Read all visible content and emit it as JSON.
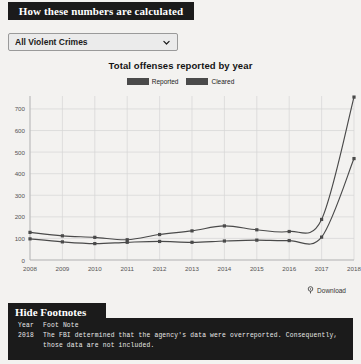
{
  "header": {
    "banner_title": "How these numbers are calculated"
  },
  "filter": {
    "selected": "All Violent Crimes",
    "chevron_icon": "chevron-down-icon"
  },
  "chart_data": {
    "type": "line",
    "title": "Total offenses reported by year",
    "xlabel": "",
    "ylabel": "",
    "x": [
      2008,
      2009,
      2010,
      2011,
      2012,
      2013,
      2014,
      2015,
      2016,
      2017,
      2018
    ],
    "categories": [
      "2008",
      "2009",
      "2010",
      "2011",
      "2012",
      "2013",
      "2014",
      "2015",
      "2016",
      "2017",
      "2018"
    ],
    "series": [
      {
        "name": "Reported",
        "color": "#4a4a4a",
        "values": [
          128,
          112,
          105,
          94,
          118,
          135,
          158,
          140,
          132,
          188,
          755
        ]
      },
      {
        "name": "Cleared",
        "color": "#4a4a4a",
        "values": [
          98,
          84,
          76,
          82,
          86,
          82,
          88,
          92,
          90,
          106,
          470
        ]
      }
    ],
    "ylim": [
      0,
      750
    ],
    "yticks": [
      0,
      100,
      200,
      300,
      400,
      500,
      600,
      700
    ],
    "ytick_labels": [
      "0",
      "100",
      "200",
      "300",
      "400",
      "500",
      "600",
      "700"
    ],
    "grid": true,
    "legend_position": "top-center",
    "legend": [
      "Reported",
      "Cleared"
    ]
  },
  "download": {
    "label": "Download",
    "icon": "download-pin-icon"
  },
  "footnotes": {
    "toggle_label": "Hide Footnotes",
    "columns": {
      "year": "Year",
      "note": "Foot Note"
    },
    "rows": [
      {
        "year": "2018",
        "note_line1": "The FBI determined that the agency's data were overreported. Consequently,",
        "note_line2": "those data are not included."
      }
    ]
  }
}
